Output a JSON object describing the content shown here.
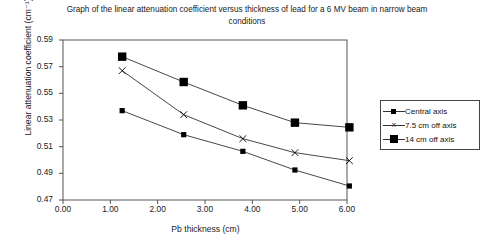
{
  "chart_data": {
    "type": "line",
    "title": "Graph of the linear attenuation coefficient versus thickness of lead for a 6 MV beam in narrow beam conditions",
    "xlabel": "Pb thickness (cm)",
    "ylabel": "Linear attenuation coefficient (cm⁻¹)",
    "xlim": [
      0.0,
      6.0
    ],
    "ylim": [
      0.47,
      0.59
    ],
    "xticks": [
      "0.00",
      "1.00",
      "2.00",
      "3.00",
      "4.00",
      "5.00",
      "6.00"
    ],
    "yticks": [
      "0.47",
      "0.49",
      "0.51",
      "0.53",
      "0.55",
      "0.57",
      "0.59"
    ],
    "grid": false,
    "legend_position": "right",
    "x": [
      1.25,
      2.55,
      3.8,
      4.9,
      6.05
    ],
    "series": [
      {
        "name": "Central axis",
        "marker": "small-square",
        "values": [
          0.537,
          0.519,
          0.5065,
          0.4925,
          0.4805
        ]
      },
      {
        "name": "7.5 cm off axis",
        "marker": "cross",
        "values": [
          0.567,
          0.534,
          0.516,
          0.5055,
          0.4995
        ]
      },
      {
        "name": "14 cm off axis",
        "marker": "large-square",
        "values": [
          0.5775,
          0.5585,
          0.541,
          0.528,
          0.5245
        ]
      }
    ]
  },
  "legend": {
    "items": [
      {
        "label": "Central axis"
      },
      {
        "label": "7.5 cm off axis"
      },
      {
        "label": "14 cm off axis"
      }
    ]
  },
  "colors": {
    "line": "#333333",
    "marker": "#000000",
    "axis": "#555555",
    "text": "#1a1a1a"
  }
}
